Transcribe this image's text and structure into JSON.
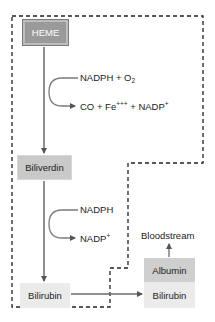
{
  "diagram": {
    "nodes": {
      "heme": "HEME",
      "biliverdin": "Biliverdin",
      "bilirubin_cell": "Bilirubin",
      "albumin": "Albumin",
      "bilirubin_bound": "Bilirubin",
      "bloodstream": "Bloodstream"
    },
    "reactions": {
      "step1": {
        "input_main": "NADPH + O",
        "input_sub": "2",
        "output_main": "CO + Fe",
        "output_sup1": "+++",
        "output_mid": " + NADP",
        "output_sup2": "+"
      },
      "step2": {
        "input": "NADPH",
        "output_main": "NADP",
        "output_sup": "+"
      }
    },
    "colors": {
      "heme_fill": "#9a9a9a",
      "biliverdin_fill": "#c9c9c9",
      "bilirubin_fill": "#ebebeb",
      "albumin_fill": "#cfcfcf",
      "arrow": "#6a6a6a",
      "dashed_border": "#222222"
    }
  }
}
